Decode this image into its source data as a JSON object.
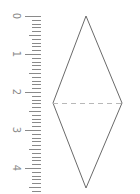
{
  "diagram": {
    "type": "ruler-and-rhombus",
    "ruler": {
      "orientation": "vertical",
      "labels": [
        "0",
        "1",
        "2",
        "3",
        "4"
      ],
      "label_rotation_deg": 90,
      "start_y": 16,
      "unit_px": 38,
      "minor_per_unit": 10,
      "extent_y": 192,
      "tick_right_x": 41,
      "major_left_x": 25,
      "medium_left_x": 29,
      "minor_left_x": 32,
      "label_x": 16,
      "color": "#8a8a8a"
    },
    "rhombus": {
      "vertices": {
        "top": [
          86,
          16
        ],
        "right": [
          122,
          103
        ],
        "bottom": [
          86,
          188
        ],
        "left": [
          53,
          103
        ]
      },
      "stroke": "#6a6a6a",
      "diagonal": {
        "from": "left",
        "to": "right",
        "style": "dashed",
        "color": "#b8b8b8"
      }
    }
  }
}
